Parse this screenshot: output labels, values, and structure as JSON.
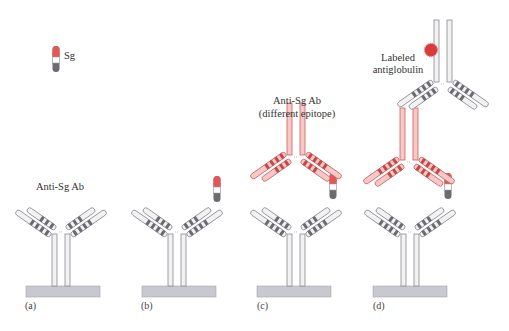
{
  "figure": {
    "panels": [
      {
        "id": "a",
        "letter": "(a)",
        "caption": "Anti-Sg Ab"
      },
      {
        "id": "b",
        "letter": "(b)",
        "caption": ""
      },
      {
        "id": "c",
        "letter": "(c)",
        "caption_line1": "Anti-Sg Ab",
        "caption_line2": "(different epitope)"
      },
      {
        "id": "d",
        "letter": "(d)",
        "caption_line1": "Labeled",
        "caption_line2": "antiglobulin"
      }
    ],
    "legend": {
      "antigen_label": "Sg"
    },
    "colors": {
      "capture_fill": "#f2f2f4",
      "capture_stroke": "#8a8a90",
      "capture_band": "#6a6a70",
      "detect_fill": "#f6c9c8",
      "detect_stroke": "#d0605d",
      "detect_band": "#c04a48",
      "antigen_top": "#e2585a",
      "antigen_mid": "#ffffff",
      "antigen_bottom": "#6b6b70",
      "plate_fill": "#c8c8cf",
      "plate_stroke": "#a6a6ae",
      "label_dot": "#d93a3c"
    }
  }
}
